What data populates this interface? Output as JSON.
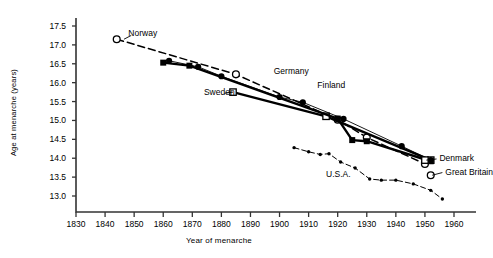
{
  "chart_data": {
    "type": "line",
    "title": "",
    "xlabel": "Year of menarche",
    "ylabel": "Age at menarche (years)",
    "xlim": [
      1830,
      1960
    ],
    "ylim": [
      12.75,
      17.6
    ],
    "xticks": [
      1830,
      1840,
      1850,
      1860,
      1870,
      1880,
      1890,
      1900,
      1910,
      1920,
      1930,
      1940,
      1950,
      1960
    ],
    "yticks": [
      13.0,
      13.5,
      14.0,
      14.5,
      15.0,
      15.5,
      16.0,
      16.5,
      17.0,
      17.5
    ],
    "grid": false,
    "legend": "inline-annotations",
    "series": [
      {
        "name": "Norway",
        "marker": "open-circle",
        "line": "dashed",
        "points": [
          {
            "x": 1844,
            "y": 17.15
          },
          {
            "x": 1885,
            "y": 16.22
          },
          {
            "x": 1920,
            "y": 15.02
          },
          {
            "x": 1930,
            "y": 14.55
          },
          {
            "x": 1950,
            "y": 13.85
          }
        ]
      },
      {
        "name": "Sweden",
        "marker": "open-square",
        "line": "solid-thick",
        "points": [
          {
            "x": 1884,
            "y": 15.75
          },
          {
            "x": 1916,
            "y": 15.11
          },
          {
            "x": 1952,
            "y": 13.95
          }
        ]
      },
      {
        "name": "Germany",
        "marker": "filled-square",
        "line": "solid-thick",
        "points": [
          {
            "x": 1860,
            "y": 16.53
          },
          {
            "x": 1869,
            "y": 16.45
          },
          {
            "x": 1920,
            "y": 15.05
          },
          {
            "x": 1925,
            "y": 14.48
          },
          {
            "x": 1930,
            "y": 14.45
          },
          {
            "x": 1952,
            "y": 13.92
          }
        ]
      },
      {
        "name": "Finland",
        "marker": "filled-circle",
        "line": "solid-thin",
        "points": [
          {
            "x": 1862,
            "y": 16.58
          },
          {
            "x": 1872,
            "y": 16.42
          },
          {
            "x": 1880,
            "y": 16.17
          },
          {
            "x": 1900,
            "y": 15.62
          },
          {
            "x": 1908,
            "y": 15.48
          },
          {
            "x": 1922,
            "y": 15.04
          },
          {
            "x": 1942,
            "y": 14.32
          },
          {
            "x": 1952,
            "y": 13.95
          }
        ]
      },
      {
        "name": "Denmark",
        "marker": "open-square",
        "line": "solid-thick",
        "points": [
          {
            "x": 1950,
            "y": 13.95
          }
        ]
      },
      {
        "name": "Great Britain",
        "marker": "open-circle",
        "line": "dashed",
        "points": [
          {
            "x": 1952,
            "y": 13.55
          }
        ]
      },
      {
        "name": "U.S.A.",
        "marker": "small-dot",
        "line": "dash-dot",
        "points": [
          {
            "x": 1905,
            "y": 14.28
          },
          {
            "x": 1910,
            "y": 14.17
          },
          {
            "x": 1914,
            "y": 14.1
          },
          {
            "x": 1917,
            "y": 14.12
          },
          {
            "x": 1921,
            "y": 13.9
          },
          {
            "x": 1926,
            "y": 13.74
          },
          {
            "x": 1931,
            "y": 13.45
          },
          {
            "x": 1935,
            "y": 13.42
          },
          {
            "x": 1940,
            "y": 13.42
          },
          {
            "x": 1946,
            "y": 13.32
          },
          {
            "x": 1952,
            "y": 13.15
          },
          {
            "x": 1956,
            "y": 12.92
          }
        ]
      }
    ],
    "annotations": [
      {
        "text": "Norway",
        "x": 1848,
        "y": 17.28
      },
      {
        "text": "Sweden",
        "x": 1874,
        "y": 15.72
      },
      {
        "text": "Germany",
        "x": 1898,
        "y": 16.28
      },
      {
        "text": "Finland",
        "x": 1913,
        "y": 15.92
      },
      {
        "text": "Denmark",
        "x": 1955,
        "y": 13.98
      },
      {
        "text": "Great Britain",
        "x": 1957,
        "y": 13.62
      },
      {
        "text": "U.S.A.",
        "x": 1916,
        "y": 13.55
      }
    ]
  }
}
